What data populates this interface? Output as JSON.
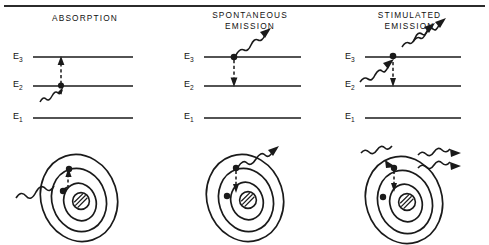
{
  "figure": {
    "top_rule": true,
    "background": "#ffffff",
    "ink_color": "#1a1a1a"
  },
  "panels": [
    {
      "id": "absorption",
      "heading_lines": [
        "ABSORPTION"
      ],
      "levels": [
        {
          "label": "E",
          "subscript": "3",
          "name": "E3"
        },
        {
          "label": "E",
          "subscript": "2",
          "name": "E2"
        },
        {
          "label": "E",
          "subscript": "1",
          "name": "E1"
        }
      ],
      "transition": {
        "direction": "up",
        "from_level": "E2",
        "to_level": "E3",
        "style": "dashed"
      },
      "electron_dot_level": "E2",
      "photons_in": 1,
      "photons_out": 0,
      "atom": {
        "orbits": 3,
        "nucleus": "hatched",
        "electron_jump": "outward",
        "incoming_photon": true,
        "outgoing_photons": 0
      }
    },
    {
      "id": "spontaneous-emission",
      "heading_lines": [
        "SPONTANEOUS",
        "EMISSION"
      ],
      "levels": [
        {
          "label": "E",
          "subscript": "3",
          "name": "E3"
        },
        {
          "label": "E",
          "subscript": "2",
          "name": "E2"
        },
        {
          "label": "E",
          "subscript": "1",
          "name": "E1"
        }
      ],
      "transition": {
        "direction": "down",
        "from_level": "E3",
        "to_level": "E2",
        "style": "dashed"
      },
      "electron_dot_level": "E3",
      "photons_in": 0,
      "photons_out": 1,
      "atom": {
        "orbits": 3,
        "nucleus": "hatched",
        "electron_jump": "inward",
        "incoming_photon": false,
        "outgoing_photons": 1
      }
    },
    {
      "id": "stimulated-emission",
      "heading_lines": [
        "STIMULATED",
        "EMISSION"
      ],
      "levels": [
        {
          "label": "E",
          "subscript": "3",
          "name": "E3"
        },
        {
          "label": "E",
          "subscript": "2",
          "name": "E2"
        },
        {
          "label": "E",
          "subscript": "1",
          "name": "E1"
        }
      ],
      "transition": {
        "direction": "down",
        "from_level": "E3",
        "to_level": "E2",
        "style": "dashed"
      },
      "electron_dot_level": "E3",
      "photons_in": 1,
      "photons_out": 2,
      "atom": {
        "orbits": 3,
        "nucleus": "hatched",
        "electron_jump": "inward",
        "incoming_photon": true,
        "outgoing_photons": 2
      }
    }
  ]
}
